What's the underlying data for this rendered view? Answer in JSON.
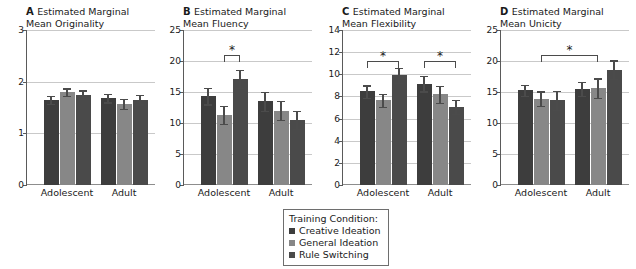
{
  "legend": {
    "title": "Training Condition:",
    "entries": [
      {
        "label": "Creative Ideation",
        "color": "#3d3d3d"
      },
      {
        "label": "General Ideation",
        "color": "#878787"
      },
      {
        "label": "Rule Switching",
        "color": "#4a4a4a"
      }
    ]
  },
  "chart_data": [
    {
      "type": "bar",
      "panel": "A",
      "title": "Estimated Marginal\nMean Originality",
      "ylabel": "",
      "xlabel": "",
      "ylim": [
        0,
        3
      ],
      "yticks": [
        0,
        1,
        2,
        3
      ],
      "ytick_labels": [
        "0",
        "1",
        "2",
        "3"
      ],
      "grid": true,
      "categories": [
        "Adolescent",
        "Adult"
      ],
      "series": [
        {
          "name": "Creative Ideation",
          "color": "#3d3d3d",
          "values": [
            1.65,
            1.68
          ],
          "errors": [
            0.08,
            0.08
          ]
        },
        {
          "name": "General Ideation",
          "color": "#878787",
          "values": [
            1.8,
            1.57
          ],
          "errors": [
            0.07,
            0.09
          ]
        },
        {
          "name": "Rule Switching",
          "color": "#4a4a4a",
          "values": [
            1.75,
            1.65
          ],
          "errors": [
            0.08,
            0.09
          ]
        }
      ],
      "annotations": []
    },
    {
      "type": "bar",
      "panel": "B",
      "title": "Estimated Marginal\nMean Fluency",
      "ylabel": "",
      "xlabel": "",
      "ylim": [
        0,
        25
      ],
      "yticks": [
        0,
        5,
        10,
        15,
        20,
        25
      ],
      "ytick_labels": [
        "0",
        "5",
        "10",
        "15",
        "20",
        "25"
      ],
      "grid": true,
      "categories": [
        "Adolescent",
        "Adult"
      ],
      "series": [
        {
          "name": "Creative Ideation",
          "color": "#3d3d3d",
          "values": [
            14.3,
            13.5
          ],
          "errors": [
            1.3,
            1.5
          ]
        },
        {
          "name": "General Ideation",
          "color": "#878787",
          "values": [
            11.3,
            12.0
          ],
          "errors": [
            1.5,
            1.5
          ]
        },
        {
          "name": "Rule Switching",
          "color": "#4a4a4a",
          "values": [
            17.1,
            10.5
          ],
          "errors": [
            1.5,
            1.5
          ]
        }
      ],
      "annotations": [
        {
          "label": "*",
          "from_group": 0,
          "from_series": 1,
          "to_group": 0,
          "to_series": 2,
          "y": 21.0
        }
      ]
    },
    {
      "type": "bar",
      "panel": "C",
      "title": "Estimated Marginal\nMean Flexibility",
      "ylabel": "",
      "xlabel": "",
      "ylim": [
        0,
        14
      ],
      "yticks": [
        0,
        2,
        4,
        6,
        8,
        10,
        12,
        14
      ],
      "ytick_labels": [
        "0",
        "2",
        "4",
        "6",
        "8",
        "10",
        "12",
        "14"
      ],
      "grid": true,
      "categories": [
        "Adolescent",
        "Adult"
      ],
      "series": [
        {
          "name": "Creative Ideation",
          "color": "#3d3d3d",
          "values": [
            8.45,
            9.15
          ],
          "errors": [
            0.55,
            0.7
          ]
        },
        {
          "name": "General Ideation",
          "color": "#878787",
          "values": [
            7.65,
            8.2
          ],
          "errors": [
            0.6,
            0.75
          ]
        },
        {
          "name": "Rule Switching",
          "color": "#4a4a4a",
          "values": [
            9.9,
            7.05
          ],
          "errors": [
            0.65,
            0.6
          ]
        }
      ],
      "annotations": [
        {
          "label": "*",
          "from_group": 0,
          "from_series": 0,
          "to_group": 0,
          "to_series": 2,
          "y": 11.2
        },
        {
          "label": "*",
          "from_group": 1,
          "from_series": 0,
          "to_group": 1,
          "to_series": 2,
          "y": 11.2
        }
      ]
    },
    {
      "type": "bar",
      "panel": "D",
      "title": "Estimated Marginal\nMean Unicity",
      "ylabel": "",
      "xlabel": "",
      "ylim": [
        0,
        25
      ],
      "yticks": [
        0,
        5,
        10,
        15,
        20,
        25
      ],
      "ytick_labels": [
        "0",
        "5",
        "10",
        "15",
        "20",
        "25"
      ],
      "grid": true,
      "categories": [
        "Adolescent",
        "Adult"
      ],
      "series": [
        {
          "name": "Creative Ideation",
          "color": "#3d3d3d",
          "values": [
            15.25,
            15.5
          ],
          "errors": [
            0.9,
            1.1
          ]
        },
        {
          "name": "General Ideation",
          "color": "#878787",
          "values": [
            13.9,
            15.6
          ],
          "errors": [
            1.2,
            1.6
          ]
        },
        {
          "name": "Rule Switching",
          "color": "#4a4a4a",
          "values": [
            13.65,
            18.6
          ],
          "errors": [
            1.5,
            1.5
          ]
        }
      ],
      "annotations": [
        {
          "label": "*",
          "from_group": 0,
          "from_series": 1,
          "to_group": 1,
          "to_series": 1,
          "y": 21.0
        }
      ]
    }
  ]
}
